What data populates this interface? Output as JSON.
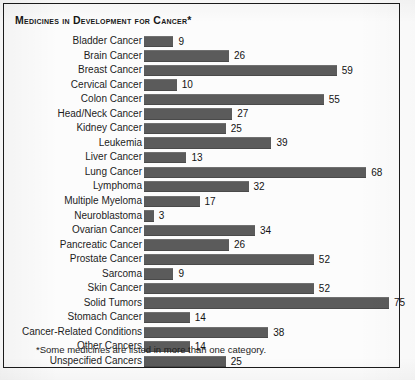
{
  "chart_title": "Medicines in Development for Cancer*",
  "footnote": "*Some medicines are listed in more than one category.",
  "colors": {
    "bar_fill": "#5b5b5b",
    "frame_border": "#1b1b1b",
    "text": "#1d1d1d",
    "background": "#fcfcfc"
  },
  "chart_data": {
    "type": "bar",
    "orientation": "horizontal",
    "title": "Medicines in Development for Cancer*",
    "xlabel": "",
    "ylabel": "",
    "grid": false,
    "legend": null,
    "xlim": [
      0,
      75
    ],
    "note": "*Some medicines are listed in more than one category.",
    "categories": [
      "Bladder Cancer",
      "Brain Cancer",
      "Breast Cancer",
      "Cervical Cancer",
      "Colon Cancer",
      "Head/Neck Cancer",
      "Kidney Cancer",
      "Leukemia",
      "Liver Cancer",
      "Lung Cancer",
      "Lymphoma",
      "Multiple Myeloma",
      "Neuroblastoma",
      "Ovarian Cancer",
      "Pancreatic Cancer",
      "Prostate Cancer",
      "Sarcoma",
      "Skin Cancer",
      "Solid Tumors",
      "Stomach Cancer",
      "Cancer-Related Conditions",
      "Other Cancers",
      "Unspecified Cancers"
    ],
    "values": [
      9,
      26,
      59,
      10,
      55,
      27,
      25,
      39,
      13,
      68,
      32,
      17,
      3,
      34,
      26,
      52,
      9,
      52,
      75,
      14,
      38,
      14,
      25
    ],
    "rows": [
      {
        "label": "Bladder Cancer",
        "value": 9,
        "value_text": "9"
      },
      {
        "label": "Brain Cancer",
        "value": 26,
        "value_text": "26"
      },
      {
        "label": "Breast Cancer",
        "value": 59,
        "value_text": "59"
      },
      {
        "label": "Cervical Cancer",
        "value": 10,
        "value_text": "10"
      },
      {
        "label": "Colon Cancer",
        "value": 55,
        "value_text": "55"
      },
      {
        "label": "Head/Neck Cancer",
        "value": 27,
        "value_text": "27"
      },
      {
        "label": "Kidney Cancer",
        "value": 25,
        "value_text": "25"
      },
      {
        "label": "Leukemia",
        "value": 39,
        "value_text": "39"
      },
      {
        "label": "Liver Cancer",
        "value": 13,
        "value_text": "13"
      },
      {
        "label": "Lung Cancer",
        "value": 68,
        "value_text": "68"
      },
      {
        "label": "Lymphoma",
        "value": 32,
        "value_text": "32"
      },
      {
        "label": "Multiple Myeloma",
        "value": 17,
        "value_text": "17"
      },
      {
        "label": "Neuroblastoma",
        "value": 3,
        "value_text": "3"
      },
      {
        "label": "Ovarian Cancer",
        "value": 34,
        "value_text": "34"
      },
      {
        "label": "Pancreatic Cancer",
        "value": 26,
        "value_text": "26"
      },
      {
        "label": "Prostate Cancer",
        "value": 52,
        "value_text": "52"
      },
      {
        "label": "Sarcoma",
        "value": 9,
        "value_text": "9"
      },
      {
        "label": "Skin Cancer",
        "value": 52,
        "value_text": "52"
      },
      {
        "label": "Solid Tumors",
        "value": 75,
        "value_text": "75"
      },
      {
        "label": "Stomach Cancer",
        "value": 14,
        "value_text": "14"
      },
      {
        "label": "Cancer-Related Conditions",
        "value": 38,
        "value_text": "38"
      },
      {
        "label": "Other Cancers",
        "value": 14,
        "value_text": "14"
      },
      {
        "label": "Unspecified Cancers",
        "value": 25,
        "value_text": "25"
      }
    ]
  }
}
